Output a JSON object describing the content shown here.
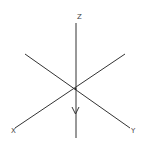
{
  "diagram": {
    "colors": {
      "line": "#333333",
      "label": "#444444",
      "background": "#ffffff"
    },
    "axes": [
      {
        "name": "Z",
        "label": "Z",
        "from": [
          76,
          23
        ],
        "to": [
          76,
          138
        ]
      },
      {
        "name": "X",
        "label": "X",
        "from": [
          125,
          54
        ],
        "to": [
          15,
          128
        ]
      },
      {
        "name": "Y",
        "label": "Y",
        "from": [
          25,
          54
        ],
        "to": [
          130,
          128
        ]
      }
    ],
    "origin": [
      75,
      89
    ],
    "arrow": {
      "direction": "down",
      "at": [
        75,
        112
      ]
    },
    "labels": {
      "z": "Z",
      "x": "X",
      "y": "Y"
    }
  }
}
